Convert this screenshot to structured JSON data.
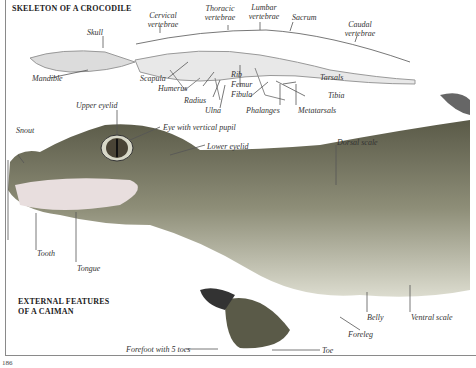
{
  "page": {
    "number": "186"
  },
  "skeleton": {
    "title": "SKELETON OF A CROCODILE",
    "labels": {
      "skull": "Skull",
      "mandible": "Mandible",
      "cervical": "Cervical vertebrae",
      "thoracic": "Thoracic vertebrae",
      "lumbar": "Lumbar vertebrae",
      "sacrum": "Sacrum",
      "caudal": "Caudal vertebrae",
      "scapula": "Scapula",
      "humerus": "Humerus",
      "radius": "Radius",
      "ulna": "Ulna",
      "rib": "Rib",
      "femur": "Femur",
      "fibula": "Fibula",
      "tarsals": "Tarsals",
      "tibia": "Tibia",
      "phalanges": "Phalanges",
      "metatarsals": "Metatarsals"
    }
  },
  "external": {
    "title_line1": "EXTERNAL FEATURES",
    "title_line2": "OF A CAIMAN",
    "labels": {
      "snout": "Snout",
      "upper_eyelid": "Upper eyelid",
      "eye": "Eye with vertical pupil",
      "lower_eyelid": "Lower eyelid",
      "dorsal_scale": "Dorsal scale",
      "tooth": "Tooth",
      "tongue": "Tongue",
      "forefoot": "Forefoot with 5 toes",
      "toe": "Toe",
      "foreleg": "Foreleg",
      "belly": "Belly",
      "ventral_scale": "Ventral scale"
    }
  },
  "colors": {
    "ink": "#333333",
    "skin_dark": "#4a4a3c",
    "skin_mid": "#8c8c78",
    "skin_light": "#d6d6c8"
  }
}
